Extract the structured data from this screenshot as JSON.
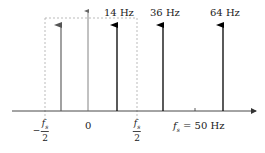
{
  "diagram": {
    "type": "frequency-spectrum",
    "impulses": [
      {
        "label": "",
        "role": "alias",
        "x": 61,
        "color": "#555555"
      },
      {
        "label": "14 Hz",
        "x": 117,
        "color": "#000000"
      },
      {
        "label": "36 Hz",
        "x": 163,
        "color": "#000000"
      },
      {
        "label": "64 Hz",
        "x": 223,
        "color": "#000000"
      }
    ],
    "axis_labels": {
      "neg_half_fs_num": "f",
      "neg_half_fs_sub": "s",
      "neg_half_fs_den": "2",
      "neg_sign": "−",
      "zero": "0",
      "half_fs_num": "f",
      "half_fs_sub": "s",
      "half_fs_den": "2",
      "fs_label_var": "f",
      "fs_label_sub": "s",
      "fs_label_value": " = 50 Hz"
    },
    "nyquist_box": {
      "style": "dashed",
      "color": "#aaaaaa"
    },
    "colors": {
      "axis": "#333333",
      "impulse": "#000000",
      "alias": "#555555",
      "dash": "#aaaaaa"
    }
  }
}
